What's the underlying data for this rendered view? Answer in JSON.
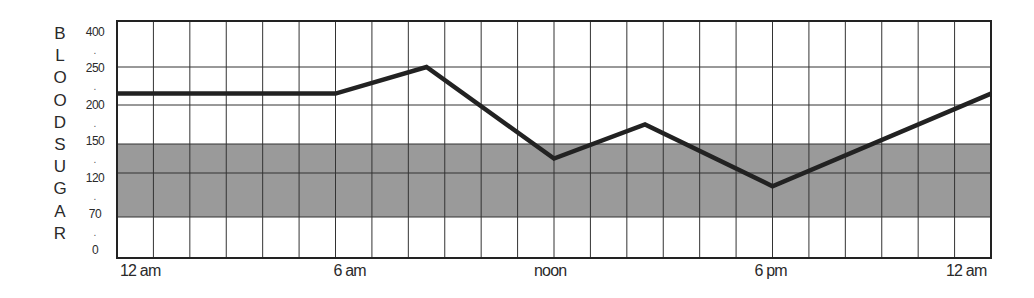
{
  "chart_data": {
    "type": "line",
    "title": "",
    "xlabel": "",
    "ylabel": "BLOODSUGAR",
    "ylabel_letters": [
      "B",
      "L",
      "O",
      "O",
      "D",
      "S",
      "U",
      "G",
      "A",
      "R"
    ],
    "y_ticks": [
      "400",
      "250",
      "200",
      "150",
      "120",
      "70",
      "0"
    ],
    "x_ticks": [
      "12 am",
      "6 am",
      "noon",
      "6 pm",
      "12 am"
    ],
    "x_tick_hours": [
      0,
      6,
      12,
      18,
      24
    ],
    "x_range_hours": [
      0,
      24
    ],
    "grid": true,
    "grid_columns": 24,
    "target_band": {
      "from": 70,
      "to": 150,
      "color": "#9a9a9a"
    },
    "series": [
      {
        "name": "Blood sugar",
        "color": "#222222",
        "points": [
          {
            "hour": 0,
            "value": 215
          },
          {
            "hour": 6,
            "value": 215
          },
          {
            "hour": 8.5,
            "value": 250
          },
          {
            "hour": 12,
            "value": 135
          },
          {
            "hour": 14.5,
            "value": 175
          },
          {
            "hour": 18,
            "value": 105
          },
          {
            "hour": 24,
            "value": 215
          }
        ]
      }
    ],
    "legend": null
  }
}
